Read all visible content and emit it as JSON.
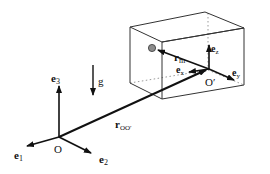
{
  "figure": {
    "labels": {
      "e1": {
        "base": "e",
        "sub": "1"
      },
      "e2": {
        "base": "e",
        "sub": "2"
      },
      "e3": {
        "base": "e",
        "sub": "3"
      },
      "O": "O",
      "g": "g",
      "r_OO": {
        "base": "r",
        "sub": "OO′"
      },
      "r_m": {
        "base": "r",
        "sub": "m"
      },
      "ex": {
        "base": "e",
        "sub": "x"
      },
      "ey": {
        "base": "e",
        "sub": "y"
      },
      "ez": {
        "base": "e",
        "sub": "z"
      },
      "O_prime": "O′"
    },
    "colors": {
      "line": "#111111",
      "dotted": "#999999",
      "mass": "#8c8c8c"
    }
  }
}
